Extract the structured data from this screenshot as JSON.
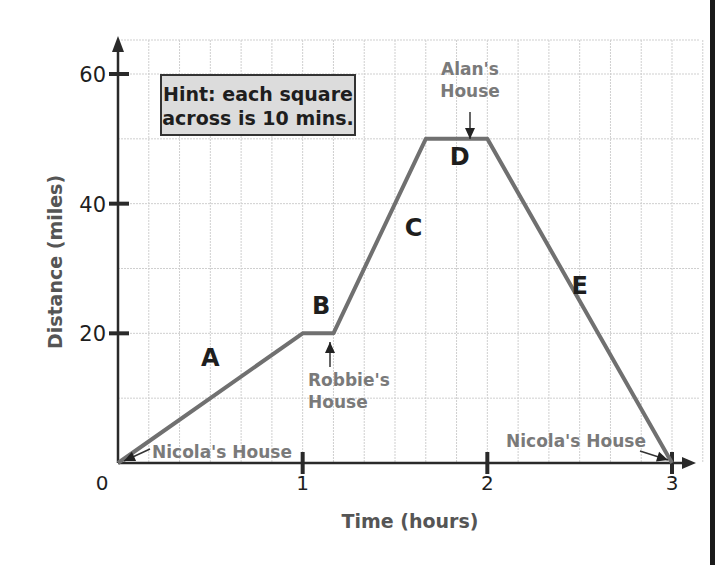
{
  "chart_data": {
    "type": "line",
    "title": "",
    "xlabel": "Time (hours)",
    "ylabel": "Distance (miles)",
    "xlim": [
      0,
      3
    ],
    "ylim": [
      0,
      60
    ],
    "x_ticks": [
      0,
      1,
      2,
      3
    ],
    "x_tick_labels": [
      "0",
      "1",
      "2",
      "3"
    ],
    "y_ticks": [
      20,
      40,
      60
    ],
    "y_tick_labels": [
      "20",
      "40",
      "60"
    ],
    "grid": true,
    "grid_minor_x_step_hours": 0.16667,
    "grid_minor_y_step_miles": 10,
    "series": [
      {
        "name": "Journey",
        "x": [
          0,
          1,
          1.1667,
          1.6667,
          2,
          3
        ],
        "y": [
          0,
          20,
          20,
          50,
          50,
          0
        ],
        "color": "#707070"
      }
    ],
    "segment_labels": [
      {
        "text": "A",
        "x": 0.5,
        "y": 15
      },
      {
        "text": "B",
        "x": 1.1,
        "y": 23
      },
      {
        "text": "C",
        "x": 1.6,
        "y": 35
      },
      {
        "text": "D",
        "x": 1.85,
        "y": 46
      },
      {
        "text": "E",
        "x": 2.5,
        "y": 26
      }
    ],
    "annotations": [
      {
        "text": "Nicola's House",
        "points_to": [
          0,
          0
        ]
      },
      {
        "text": "Robbie's\nHouse",
        "points_to": [
          1.1,
          20
        ]
      },
      {
        "text": "Alan's\nHouse",
        "points_to": [
          1.85,
          50
        ]
      },
      {
        "text": "Nicola's House",
        "points_to": [
          3,
          0
        ]
      }
    ],
    "hint": "Hint: each square\nacross is 10 mins."
  },
  "colors": {
    "line": "#707070",
    "axis": "#2a2a2a",
    "grid": "#cfcfcf",
    "annotation": "#7a7a7a",
    "label": "#1e1e1e",
    "hint_bg": "#dcdcdc"
  }
}
